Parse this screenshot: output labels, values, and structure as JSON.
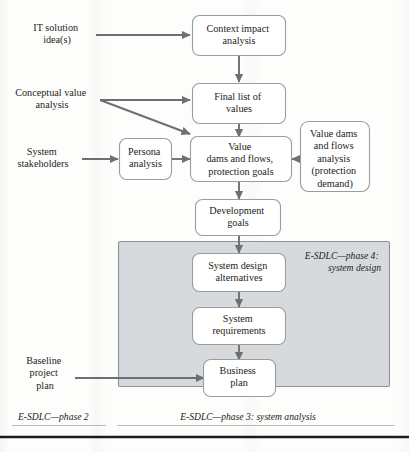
{
  "figure": {
    "colors": {
      "node_fill": "#ffffff",
      "node_stroke": "#9b9c9e",
      "phase_fill": "#d7dadd",
      "phase_stroke": "#8d9195",
      "arrow": "#6d7073",
      "text": "#1d1d1b",
      "bottom_rule": "#1b1b1b"
    }
  },
  "nodes": {
    "context_impact": {
      "lines": [
        "Context impact",
        "analysis"
      ]
    },
    "final_list": {
      "lines": [
        "Final list of",
        "values"
      ]
    },
    "value_dams": {
      "lines": [
        "Value",
        "dams and flows,",
        "protection goals"
      ]
    },
    "persona": {
      "lines": [
        "Persona",
        "analysis"
      ]
    },
    "value_dams_analysis": {
      "lines": [
        "Value dams",
        "and flows",
        "analysis",
        "(protection",
        "demand)"
      ]
    },
    "development_goals": {
      "lines": [
        "Development",
        "goals"
      ]
    },
    "system_design_alternatives": {
      "lines": [
        "System design",
        "alternatives"
      ]
    },
    "system_requirements": {
      "lines": [
        "System",
        "requirements"
      ]
    },
    "business_plan": {
      "lines": [
        "Business",
        "plan"
      ]
    }
  },
  "inputs": {
    "it_solution": {
      "lines": [
        "IT solution",
        "idea(s)"
      ]
    },
    "conceptual_value": {
      "lines": [
        "Conceptual value",
        "analysis"
      ]
    },
    "system_stakeholders": {
      "lines": [
        "System",
        "stakeholders"
      ]
    },
    "baseline_plan": {
      "lines": [
        "Baseline",
        "project",
        "plan"
      ]
    }
  },
  "phases": {
    "phase4": {
      "lines": [
        "E-SDLC—phase 4:",
        "system design"
      ]
    },
    "phase2": {
      "label": "E-SDLC—phase 2"
    },
    "phase3": {
      "label": "E-SDLC—phase 3: system analysis"
    }
  }
}
